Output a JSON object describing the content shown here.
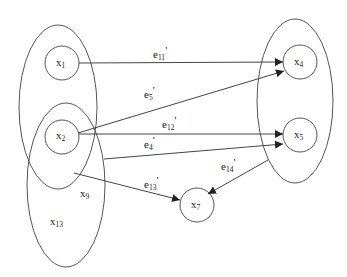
{
  "diagram": {
    "type": "hypergraph",
    "groups": [
      {
        "id": "group-a",
        "members": [
          "x1",
          "x2"
        ]
      },
      {
        "id": "group-b",
        "members": [
          "x2",
          "x9",
          "x13"
        ]
      },
      {
        "id": "group-c",
        "members": [
          "x4",
          "x5"
        ]
      }
    ],
    "nodes": [
      {
        "id": "x1",
        "base": "x",
        "sub": "1"
      },
      {
        "id": "x2",
        "base": "x",
        "sub": "2"
      },
      {
        "id": "x4",
        "base": "x",
        "sub": "4"
      },
      {
        "id": "x5",
        "base": "x",
        "sub": "5"
      },
      {
        "id": "x7",
        "base": "x",
        "sub": "7"
      },
      {
        "id": "x9",
        "base": "x",
        "sub": "9"
      },
      {
        "id": "x13",
        "base": "x",
        "sub": "13"
      }
    ],
    "edges": [
      {
        "id": "e11",
        "base": "e",
        "sub": "11",
        "prime": "'",
        "from": "x1",
        "to": "x4"
      },
      {
        "id": "e5",
        "base": "e",
        "sub": "5",
        "prime": "'",
        "from": "x2",
        "to": "x4"
      },
      {
        "id": "e12",
        "base": "e",
        "sub": "12",
        "prime": "'",
        "from": "x2",
        "to": "x5"
      },
      {
        "id": "e4",
        "base": "e",
        "sub": "4",
        "prime": "'",
        "from": "group-b",
        "to": "x5"
      },
      {
        "id": "e13",
        "base": "e",
        "sub": "13",
        "prime": "'",
        "from": "group-b",
        "to": "x7"
      },
      {
        "id": "e14",
        "base": "e",
        "sub": "14",
        "prime": "'",
        "from": "group-c",
        "to": "x7"
      }
    ]
  }
}
